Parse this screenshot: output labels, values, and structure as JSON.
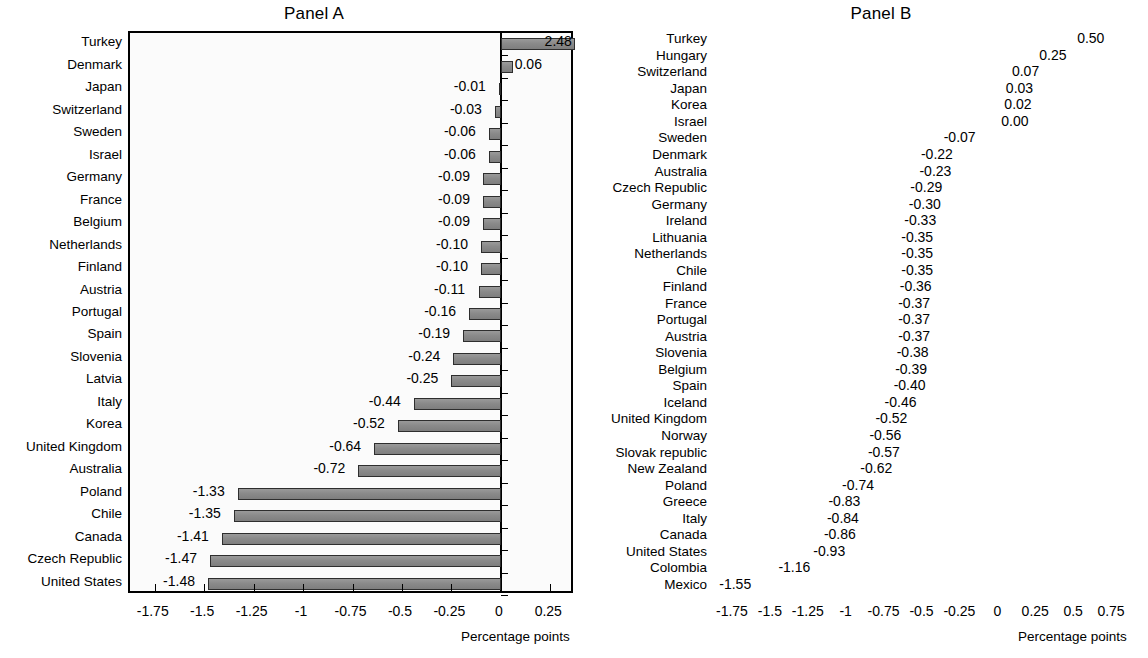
{
  "figure": {
    "axis_title": "Percentage points"
  },
  "panels": [
    {
      "id": "a",
      "title": "Panel A",
      "xlabel": "Percentage points",
      "xlim": [
        -1.875,
        0.375
      ],
      "ticks": [
        -1.75,
        -1.5,
        -1.25,
        -1,
        -0.75,
        -0.5,
        -0.25,
        0,
        0.25
      ],
      "tick_labels": [
        "-1.75",
        "-1.5",
        "-1.25",
        "-1",
        "-0.75",
        "-0.5",
        "-0.25",
        "0",
        "0.25"
      ],
      "categories": [
        "Turkey",
        "Denmark",
        "Japan",
        "Switzerland",
        "Sweden",
        "Israel",
        "Germany",
        "France",
        "Belgium",
        "Netherlands",
        "Finland",
        "Austria",
        "Portugal",
        "Spain",
        "Slovenia",
        "Latvia",
        "Italy",
        "Korea",
        "United Kingdom",
        "Australia",
        "Poland",
        "Chile",
        "Canada",
        "Czech Republic",
        "United States"
      ],
      "values": [
        2.48,
        0.06,
        -0.01,
        -0.03,
        -0.06,
        -0.06,
        -0.09,
        -0.09,
        -0.09,
        -0.1,
        -0.1,
        -0.11,
        -0.16,
        -0.19,
        -0.24,
        -0.25,
        -0.44,
        -0.52,
        -0.64,
        -0.72,
        -1.33,
        -1.35,
        -1.41,
        -1.47,
        -1.48
      ],
      "value_labels": [
        "2.48",
        "0.06",
        "-0.01",
        "-0.03",
        "-0.06",
        "-0.06",
        "-0.09",
        "-0.09",
        "-0.09",
        "-0.10",
        "-0.10",
        "-0.11",
        "-0.16",
        "-0.19",
        "-0.24",
        "-0.25",
        "-0.44",
        "-0.52",
        "-0.64",
        "-0.72",
        "-1.33",
        "-1.35",
        "-1.41",
        "-1.47",
        "-1.48"
      ]
    },
    {
      "id": "b",
      "title": "Panel B",
      "xlabel": "Percentage points",
      "xlim": [
        -1.875,
        0.875
      ],
      "ticks": [
        -1.75,
        -1.5,
        -1.25,
        -1,
        -0.75,
        -0.5,
        -0.25,
        0,
        0.25,
        0.5,
        0.75
      ],
      "tick_labels": [
        "-1.75",
        "-1.5",
        "-1.25",
        "-1",
        "-0.75",
        "-0.5",
        "-0.25",
        "0",
        "0.25",
        "0.5",
        "0.75"
      ],
      "categories": [
        "Turkey",
        "Hungary",
        "Switzerland",
        "Japan",
        "Korea",
        "Israel",
        "Sweden",
        "Denmark",
        "Australia",
        "Czech Republic",
        "Germany",
        "Ireland",
        "Lithuania",
        "Netherlands",
        "Chile",
        "Finland",
        "France",
        "Portugal",
        "Austria",
        "Slovenia",
        "Belgium",
        "Spain",
        "Iceland",
        "United Kingdom",
        "Norway",
        "Slovak republic",
        "New Zealand",
        "Poland",
        "Greece",
        "Italy",
        "Canada",
        "United States",
        "Colombia",
        "Mexico"
      ],
      "values": [
        0.5,
        0.25,
        0.07,
        0.03,
        0.02,
        0.0,
        -0.07,
        -0.22,
        -0.23,
        -0.29,
        -0.3,
        -0.33,
        -0.35,
        -0.35,
        -0.35,
        -0.36,
        -0.37,
        -0.37,
        -0.37,
        -0.38,
        -0.39,
        -0.4,
        -0.46,
        -0.52,
        -0.56,
        -0.57,
        -0.62,
        -0.74,
        -0.83,
        -0.84,
        -0.86,
        -0.93,
        -1.16,
        -1.55
      ],
      "value_labels": [
        "0.50",
        "0.25",
        "0.07",
        "0.03",
        "0.02",
        "0.00",
        "-0.07",
        "-0.22",
        "-0.23",
        "-0.29",
        "-0.30",
        "-0.33",
        "-0.35",
        "-0.35",
        "-0.35",
        "-0.36",
        "-0.37",
        "-0.37",
        "-0.37",
        "-0.38",
        "-0.39",
        "-0.40",
        "-0.46",
        "-0.52",
        "-0.56",
        "-0.57",
        "-0.62",
        "-0.74",
        "-0.83",
        "-0.84",
        "-0.86",
        "-0.93",
        "-1.16",
        "-1.55"
      ]
    }
  ],
  "chart_data": [
    {
      "type": "bar",
      "orientation": "horizontal",
      "title": "Panel A",
      "xlabel": "Percentage points",
      "ylabel": "",
      "xlim": [
        -1.875,
        0.375
      ],
      "grid": false,
      "legend": "none",
      "categories": [
        "Turkey",
        "Denmark",
        "Japan",
        "Switzerland",
        "Sweden",
        "Israel",
        "Germany",
        "France",
        "Belgium",
        "Netherlands",
        "Finland",
        "Austria",
        "Portugal",
        "Spain",
        "Slovenia",
        "Latvia",
        "Italy",
        "Korea",
        "United Kingdom",
        "Australia",
        "Poland",
        "Chile",
        "Canada",
        "Czech Republic",
        "United States"
      ],
      "values": [
        2.48,
        0.06,
        -0.01,
        -0.03,
        -0.06,
        -0.06,
        -0.09,
        -0.09,
        -0.09,
        -0.1,
        -0.1,
        -0.11,
        -0.16,
        -0.19,
        -0.24,
        -0.25,
        -0.44,
        -0.52,
        -0.64,
        -0.72,
        -1.33,
        -1.35,
        -1.41,
        -1.47,
        -1.48
      ],
      "tick_labels": [
        "-1.75",
        "-1.5",
        "-1.25",
        "-1",
        "-0.75",
        "-0.5",
        "-0.25",
        "0",
        "0.25"
      ],
      "notes": "Turkey bar (2.48) extends beyond the right edge of the plotting area; its data label overlaps the bar tip."
    },
    {
      "type": "bar",
      "orientation": "horizontal",
      "title": "Panel B",
      "xlabel": "Percentage points",
      "ylabel": "",
      "xlim": [
        -1.875,
        0.875
      ],
      "grid": false,
      "legend": "none",
      "categories": [
        "Turkey",
        "Hungary",
        "Switzerland",
        "Japan",
        "Korea",
        "Israel",
        "Sweden",
        "Denmark",
        "Australia",
        "Czech Republic",
        "Germany",
        "Ireland",
        "Lithuania",
        "Netherlands",
        "Chile",
        "Finland",
        "France",
        "Portugal",
        "Austria",
        "Slovenia",
        "Belgium",
        "Spain",
        "Iceland",
        "United Kingdom",
        "Norway",
        "Slovak republic",
        "New Zealand",
        "Poland",
        "Greece",
        "Italy",
        "Canada",
        "United States",
        "Colombia",
        "Mexico"
      ],
      "values": [
        0.5,
        0.25,
        0.07,
        0.03,
        0.02,
        0.0,
        -0.07,
        -0.22,
        -0.23,
        -0.29,
        -0.3,
        -0.33,
        -0.35,
        -0.35,
        -0.35,
        -0.36,
        -0.37,
        -0.37,
        -0.37,
        -0.38,
        -0.39,
        -0.4,
        -0.46,
        -0.52,
        -0.56,
        -0.57,
        -0.62,
        -0.74,
        -0.83,
        -0.84,
        -0.86,
        -0.93,
        -1.16,
        -1.55
      ],
      "tick_labels": [
        "-1.75",
        "-1.5",
        "-1.25",
        "-1",
        "-0.75",
        "-0.5",
        "-0.25",
        "0",
        "0.25",
        "0.5",
        "0.75"
      ],
      "notes": "Mexico bar (-1.55) extends past the left edge; its label sits at the plot's left boundary."
    }
  ]
}
